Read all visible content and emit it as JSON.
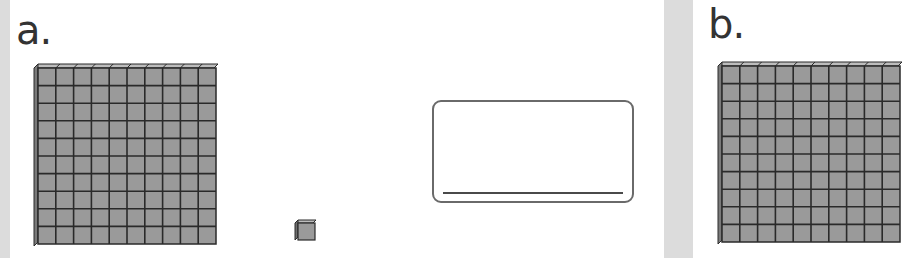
{
  "worksheet": {
    "problems": [
      {
        "label": "a.",
        "blocks": [
          {
            "type": "hundreds-flat",
            "count": 1,
            "grid": [
              10,
              10
            ]
          },
          {
            "type": "ones-cube",
            "count": 1
          }
        ],
        "answer_box": {
          "value": ""
        }
      },
      {
        "label": "b.",
        "blocks": [
          {
            "type": "hundreds-flat",
            "count": 1,
            "grid": [
              10,
              10
            ]
          }
        ]
      }
    ]
  },
  "colors": {
    "block_fill": "#9a9a9a",
    "block_line": "#2a2a2a",
    "gutter": "#dcdcdc",
    "label": "#333333"
  }
}
